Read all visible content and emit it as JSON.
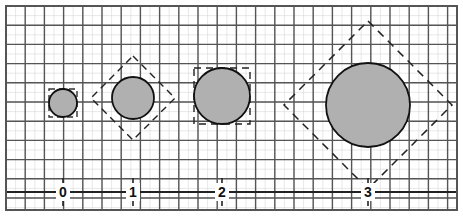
{
  "figure": {
    "type": "geometric-diagram",
    "title": "",
    "background_color": "#ffffff",
    "frame": {
      "x": 6,
      "y": 6,
      "width": 451,
      "height": 204,
      "stroke": "#555555",
      "stroke_width": 2,
      "fill": "#ffffff"
    }
  },
  "grid": {
    "cell_size": 19.2,
    "minor_cell_size": 9.6,
    "major_color": "#555555",
    "minor_color": "#d8d8d8",
    "major_width": 1.4,
    "minor_width": 0.6,
    "show_minor": true,
    "show_major": true
  },
  "axis": {
    "orientation": "horizontal",
    "y": 192,
    "x_start": 6,
    "x_end": 457,
    "color": "#222222",
    "width": 2,
    "ticks": [
      {
        "label": "0",
        "x": 63
      },
      {
        "label": "1",
        "x": 133
      },
      {
        "label": "2",
        "x": 222
      },
      {
        "label": "3",
        "x": 368
      }
    ],
    "tick_line_color": "#222222"
  },
  "colors": {
    "circle_fill": "#b0b0b0",
    "circle_stroke": "#111111",
    "dashed_stroke": "#222222",
    "label_color": "#111111",
    "grid_major": "#555555",
    "grid_minor": "#d8d8d8"
  },
  "chart_data": {
    "type": "scatter",
    "title": "",
    "xlabel": "",
    "ylabel": "",
    "note": "Four filled circles of increasing radius positioned at x = 0,1,2,3; each circle is inscribed in a dashed bounding square that alternates between axis-aligned and rotated 45 degrees.",
    "categories": [
      "0",
      "1",
      "2",
      "3"
    ],
    "values": [
      14,
      21,
      28,
      42
    ],
    "series": [
      {
        "name": "radius_px",
        "values": [
          14,
          21,
          28,
          42
        ]
      },
      {
        "name": "diameter_px",
        "values": [
          28,
          42,
          56,
          84
        ]
      },
      {
        "name": "diameter_cells",
        "values": [
          1.5,
          2.2,
          2.9,
          4.4
        ]
      }
    ]
  },
  "shapes": [
    {
      "name": "circle-0",
      "label": "0",
      "cx": 63,
      "cy": 103,
      "r": 14,
      "fill": "#b0b0b0",
      "stroke": "#111111",
      "stroke_width": 1.8,
      "bounding_box": {
        "style": "axis-aligned",
        "rotation_deg": 0,
        "half_size": 14,
        "dash": "6 4",
        "stroke": "#333333",
        "stroke_width": 1.4,
        "visible": true,
        "partial": true
      }
    },
    {
      "name": "circle-1",
      "label": "1",
      "cx": 133,
      "cy": 98,
      "r": 21,
      "fill": "#b0b0b0",
      "stroke": "#111111",
      "stroke_width": 1.8,
      "bounding_box": {
        "style": "rotated-diamond",
        "rotation_deg": 45,
        "half_size": 29.7,
        "dash": "7 5",
        "stroke": "#222222",
        "stroke_width": 1.4,
        "visible": true,
        "partial": false
      }
    },
    {
      "name": "circle-2",
      "label": "2",
      "cx": 222,
      "cy": 96,
      "r": 28,
      "fill": "#b0b0b0",
      "stroke": "#111111",
      "stroke_width": 1.8,
      "bounding_box": {
        "style": "axis-aligned",
        "rotation_deg": 0,
        "half_size": 28,
        "dash": "7 5",
        "stroke": "#222222",
        "stroke_width": 1.4,
        "visible": true,
        "partial": false
      }
    },
    {
      "name": "circle-3",
      "label": "3",
      "cx": 368,
      "cy": 105,
      "r": 42,
      "fill": "#b0b0b0",
      "stroke": "#111111",
      "stroke_width": 1.8,
      "bounding_box": {
        "style": "rotated-diamond",
        "rotation_deg": 45,
        "half_size": 59.4,
        "dash": "8 6",
        "stroke": "#222222",
        "stroke_width": 1.5,
        "visible": true,
        "partial": false
      }
    }
  ]
}
